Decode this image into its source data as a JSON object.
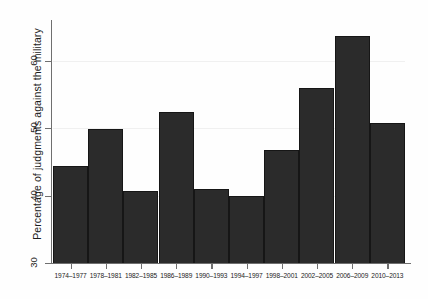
{
  "chart_data": {
    "type": "bar",
    "title": "",
    "subtitle": "",
    "xlabel": "",
    "ylabel": "Percentage of judgments against the military",
    "categories": [
      "1974–1977",
      "1978–1981",
      "1982–1985",
      "1986–1989",
      "1990–1993",
      "1994–1997",
      "1998–2001",
      "2002–2005",
      "2006–2009",
      "2010–2013"
    ],
    "values": [
      44.3,
      49.8,
      40.6,
      52.3,
      40.9,
      40.0,
      46.7,
      55.9,
      63.6,
      50.7
    ],
    "ylim": [
      30,
      66
    ],
    "yticks": [
      30,
      40,
      50,
      60
    ],
    "ytick_labels": [
      "30",
      "40",
      "50",
      "60"
    ],
    "grid": true,
    "legend": false,
    "legend_position": "none",
    "bar_color": "#2b2b2b",
    "background_color": "#ffffff",
    "axis_color": "#6f6f6f"
  }
}
